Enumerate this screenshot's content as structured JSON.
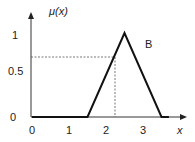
{
  "chart_data": {
    "type": "line",
    "title": "",
    "xlabel": "x",
    "ylabel": "μ(x)",
    "series": [
      {
        "name": "B",
        "x": [
          0,
          1.5,
          2.5,
          3.5,
          3.7
        ],
        "values": [
          0,
          0,
          1,
          0,
          0
        ]
      }
    ],
    "annotations": [
      {
        "type": "dashed-guide",
        "x": 2.2,
        "y": 0.7
      }
    ],
    "xticks": [
      "0",
      "1",
      "2",
      "3"
    ],
    "yticks": [
      "0",
      "0.5",
      "1"
    ],
    "xlim": [
      0,
      3.9
    ],
    "ylim": [
      0,
      1.1
    ],
    "grid": false
  },
  "labels": {
    "ylabel": "μ(x)",
    "xlabel": "x",
    "series_label": "B",
    "y1": "1",
    "y05": "0.5",
    "y0": "0",
    "x0": "0",
    "x1": "1",
    "x2": "2",
    "x3": "3"
  }
}
